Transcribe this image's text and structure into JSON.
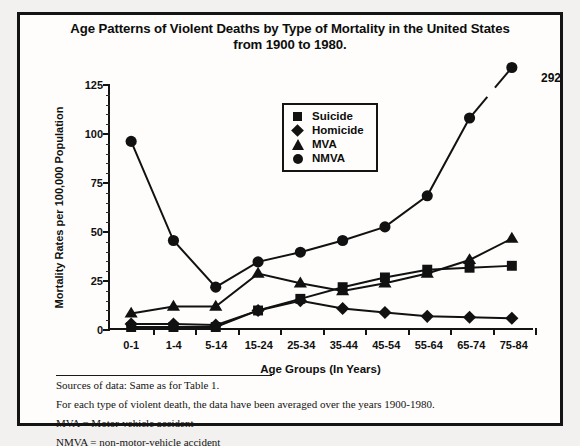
{
  "title": {
    "line1": "Age Patterns of Violent Deaths by Type of Mortality in the United States",
    "line2": "from 1900 to 1980."
  },
  "legend": [
    {
      "label": "Suicide",
      "marker": "square-marker-icon"
    },
    {
      "label": "Homicide",
      "marker": "diamond-marker-icon"
    },
    {
      "label": "MVA",
      "marker": "triangle-marker-icon"
    },
    {
      "label": "NMVA",
      "marker": "circle-marker-icon"
    }
  ],
  "annotation": {
    "peak_value_label": "292"
  },
  "notes": [
    "Sources of data:  Same as for Table 1.",
    "For each type of violent death, the data have been averaged over the years 1900-1980.",
    "MVA  =  Motor-vehicle accident",
    "NMVA  =  non-motor-vehicle accident"
  ],
  "chart_data": {
    "type": "line",
    "title": "Age Patterns of Violent Deaths by Type of Mortality in the United States from 1900 to 1980.",
    "xlabel": "Age Groups (In Years)",
    "ylabel": "Mortality Rates per 100,000 Population",
    "categories": [
      "0-1",
      "1-4",
      "5-14",
      "15-24",
      "25-34",
      "35-44",
      "45-54",
      "55-64",
      "65-74",
      "75-84"
    ],
    "ylim": [
      0,
      125
    ],
    "yticks": [
      0,
      25,
      50,
      75,
      100,
      125
    ],
    "ytick_labels": [
      "0",
      "25",
      "50",
      "75",
      "100",
      "125"
    ],
    "minor_tick_interval": 5,
    "grid": false,
    "legend_position": "upper-center",
    "series": [
      {
        "name": "Suicide",
        "marker": "square",
        "values": [
          0.5,
          0.5,
          0.5,
          9,
          15,
          21,
          26,
          30,
          31,
          32
        ]
      },
      {
        "name": "Homicide",
        "marker": "diamond",
        "values": [
          2,
          2,
          1.5,
          9,
          14,
          10,
          8,
          6,
          5.5,
          5
        ]
      },
      {
        "name": "MVA",
        "marker": "triangle",
        "values": [
          7.5,
          11,
          11,
          28,
          23,
          19,
          23,
          28,
          35,
          46
        ]
      },
      {
        "name": "NMVA",
        "marker": "circle",
        "values": [
          96,
          45,
          21,
          34,
          39,
          45,
          52,
          68,
          108,
          134
        ]
      }
    ],
    "annotations": [
      {
        "series": "NMVA",
        "category": "75-84",
        "text": "292",
        "note": "axis break: true value 292 plotted off-scale at 134"
      }
    ]
  }
}
